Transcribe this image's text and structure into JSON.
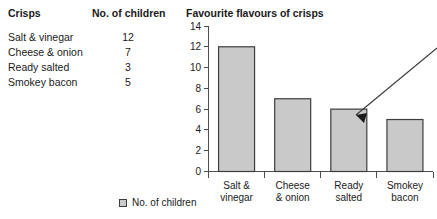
{
  "table": {
    "headers": [
      "Crisps",
      "No. of children"
    ],
    "rows": [
      {
        "flavour": "Salt & vinegar",
        "count": "12"
      },
      {
        "flavour": "Cheese & onion",
        "count": "7"
      },
      {
        "flavour": "Ready salted",
        "count": "3"
      },
      {
        "flavour": "Smokey bacon",
        "count": "5"
      }
    ]
  },
  "legend": {
    "swatch_color": "#c9c9c9",
    "label": "No. of children"
  },
  "annotation": {
    "name": "pointer-arrow",
    "points_to": "Ready salted bar"
  },
  "chart_data": {
    "type": "bar",
    "title": "Favourite flavours of crisps",
    "categories": [
      "Salt &\nvinegar",
      "Cheese\n& onion",
      "Ready\nsalted",
      "Smokey\nbacon"
    ],
    "category_lines": [
      [
        "Salt &",
        "vinegar"
      ],
      [
        "Cheese",
        "& onion"
      ],
      [
        "Ready",
        "salted"
      ],
      [
        "Smokey",
        "bacon"
      ]
    ],
    "values": [
      12,
      7,
      6,
      5
    ],
    "series": [
      {
        "name": "No. of children",
        "values": [
          12,
          7,
          6,
          5
        ]
      }
    ],
    "xlabel": "",
    "ylabel": "",
    "ylim": [
      0,
      14
    ],
    "yticks": [
      0,
      2,
      4,
      6,
      8,
      10,
      12,
      14
    ],
    "ytick_labels": [
      "0",
      "2",
      "4",
      "6",
      "8",
      "10",
      "12",
      "14"
    ],
    "grid": false,
    "legend_position": "bottom-left",
    "bar_color": "#c9c9c9",
    "bar_edge_color": "#3d3d3d"
  }
}
